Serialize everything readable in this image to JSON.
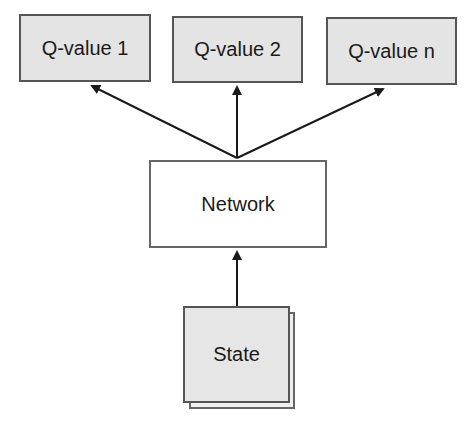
{
  "diagram": {
    "outputs": [
      {
        "label": "Q-value 1"
      },
      {
        "label": "Q-value 2"
      },
      {
        "label": "Q-value n"
      }
    ],
    "network": {
      "label": "Network"
    },
    "input": {
      "label": "State"
    },
    "edges": [
      {
        "from": "State",
        "to": "Network"
      },
      {
        "from": "Network",
        "to": "Q-value 1"
      },
      {
        "from": "Network",
        "to": "Q-value 2"
      },
      {
        "from": "Network",
        "to": "Q-value n"
      }
    ],
    "colors": {
      "box_fill": "#e4e4e4",
      "border": "#555555",
      "network_fill": "#ffffff",
      "arrow": "#1a1a1a"
    }
  }
}
